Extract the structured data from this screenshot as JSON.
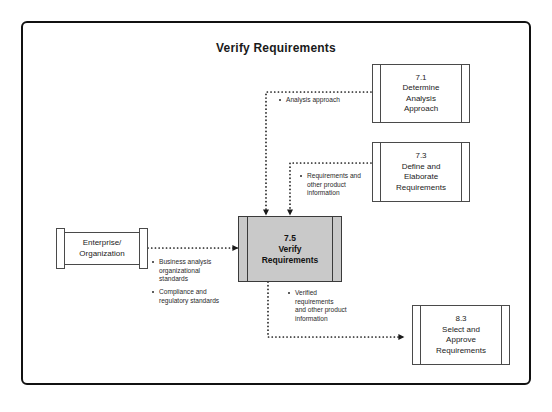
{
  "diagram": {
    "title": "Verify Requirements",
    "type": "data-flow-diagram"
  },
  "entities": {
    "enterprise": {
      "label": "Enterprise/\nOrganization",
      "role": "external-entity"
    }
  },
  "process": {
    "id": "7.5",
    "name": "Verify\nRequirements",
    "label": "7.5\nVerify\nRequirements",
    "fill_color": "#c9c9c9"
  },
  "tasks": [
    {
      "id": "7.1",
      "name": "Determine\nAnalysis\nApproach",
      "label": "7.1\nDetermine\nAnalysis\nApproach"
    },
    {
      "id": "7.3",
      "name": "Define and\nElaborate\nRequirements",
      "label": "7.3\nDefine and\nElaborate\nRequirements"
    },
    {
      "id": "8.3",
      "name": "Select and\nApprove\nRequirements",
      "label": "8.3\nSelect and\nApprove\nRequirements"
    }
  ],
  "flows": [
    {
      "from": "7.1",
      "to": "7.5",
      "items": [
        "Analysis approach"
      ]
    },
    {
      "from": "7.3",
      "to": "7.5",
      "items": [
        "Requirements and\nother product\ninformation"
      ]
    },
    {
      "from": "Enterprise/Organization",
      "to": "7.5",
      "items": [
        "Business analysis\norganizational\nstandards",
        "Compliance and\nregulatory standards"
      ]
    },
    {
      "from": "7.5",
      "to": "8.3",
      "items": [
        "Verified\nrequirements\nand other product\ninformation"
      ]
    }
  ],
  "colors": {
    "frame_border": "#111111",
    "box_border": "#4a4a4a",
    "process_fill": "#c9c9c9",
    "connector": "#1a1a1a",
    "text": "#222222"
  }
}
